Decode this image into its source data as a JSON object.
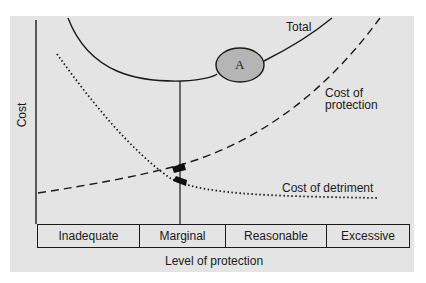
{
  "diagram": {
    "y_axis_label": "Cost",
    "x_axis_label": "Level of protection",
    "curves": {
      "total": "Total",
      "protection_line1": "Cost of",
      "protection_line2": "protection",
      "detriment": "Cost of detriment"
    },
    "marker": "A",
    "levels": [
      "Inadequate",
      "Marginal",
      "Reasonable",
      "Excessive"
    ]
  }
}
